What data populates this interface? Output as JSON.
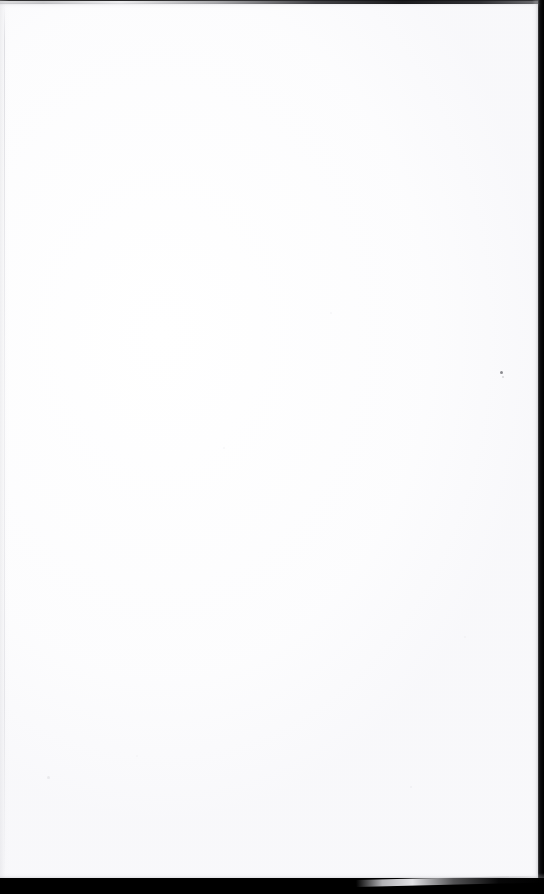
{
  "document": {
    "kind": "scanned-page",
    "content_state": "blank",
    "page_text": "",
    "visible_text_lines": [],
    "note": "Blank page — no printed text, headings, figures or page number are rendered in the pixels."
  },
  "canvas": {
    "width_px": 544,
    "height_px": 894,
    "background_color": "#000000"
  },
  "sheet": {
    "color": "#ffffff",
    "left_px": 0,
    "top_px": 1,
    "width_px": 538,
    "height_px": 879
  },
  "edges": {
    "top": {
      "label": "top-scan-edge",
      "height_px": 4,
      "color_light": "#96969a",
      "color_dark": "#121214"
    },
    "right": {
      "label": "right-scan-edge",
      "width_px": 6,
      "color": "#000000"
    },
    "bottom": {
      "label": "bottom-scan-edge",
      "height_px": 16,
      "color": "#000000",
      "sliver_label": "lifted-corner-highlight",
      "sliver_color": "#eeeef1",
      "sliver_angle_deg": -1.35
    },
    "left": {
      "label": "left-paper-fold-line",
      "x_px": 4,
      "color": "#d6d6db"
    }
  },
  "artifacts": [
    {
      "name": "dust-speck-1",
      "x_px": 500,
      "y_px": 371,
      "size_px": 3,
      "color": "#6f6f76",
      "opacity": 0.8
    },
    {
      "name": "dust-speck-2",
      "x_px": 502,
      "y_px": 376,
      "size_px": 2,
      "color": "#a8a8b0",
      "opacity": 0.45
    },
    {
      "name": "dust-speck-3",
      "x_px": 47,
      "y_px": 776,
      "size_px": 3,
      "color": "#d2d2d8",
      "opacity": 0.4
    },
    {
      "name": "dust-speck-4",
      "x_px": 410,
      "y_px": 786,
      "size_px": 2,
      "color": "#dcdce1",
      "opacity": 0.35
    },
    {
      "name": "dust-speck-5",
      "x_px": 223,
      "y_px": 447,
      "size_px": 2,
      "color": "#e2e2e7",
      "opacity": 0.3
    },
    {
      "name": "dust-speck-6",
      "x_px": 330,
      "y_px": 312,
      "size_px": 2,
      "color": "#e4e4e9",
      "opacity": 0.28
    },
    {
      "name": "dust-speck-7",
      "x_px": 464,
      "y_px": 636,
      "size_px": 2,
      "color": "#e0e0e6",
      "opacity": 0.3
    },
    {
      "name": "dust-speck-8",
      "x_px": 136,
      "y_px": 755,
      "size_px": 2,
      "color": "#e3e3e8",
      "opacity": 0.26
    }
  ]
}
